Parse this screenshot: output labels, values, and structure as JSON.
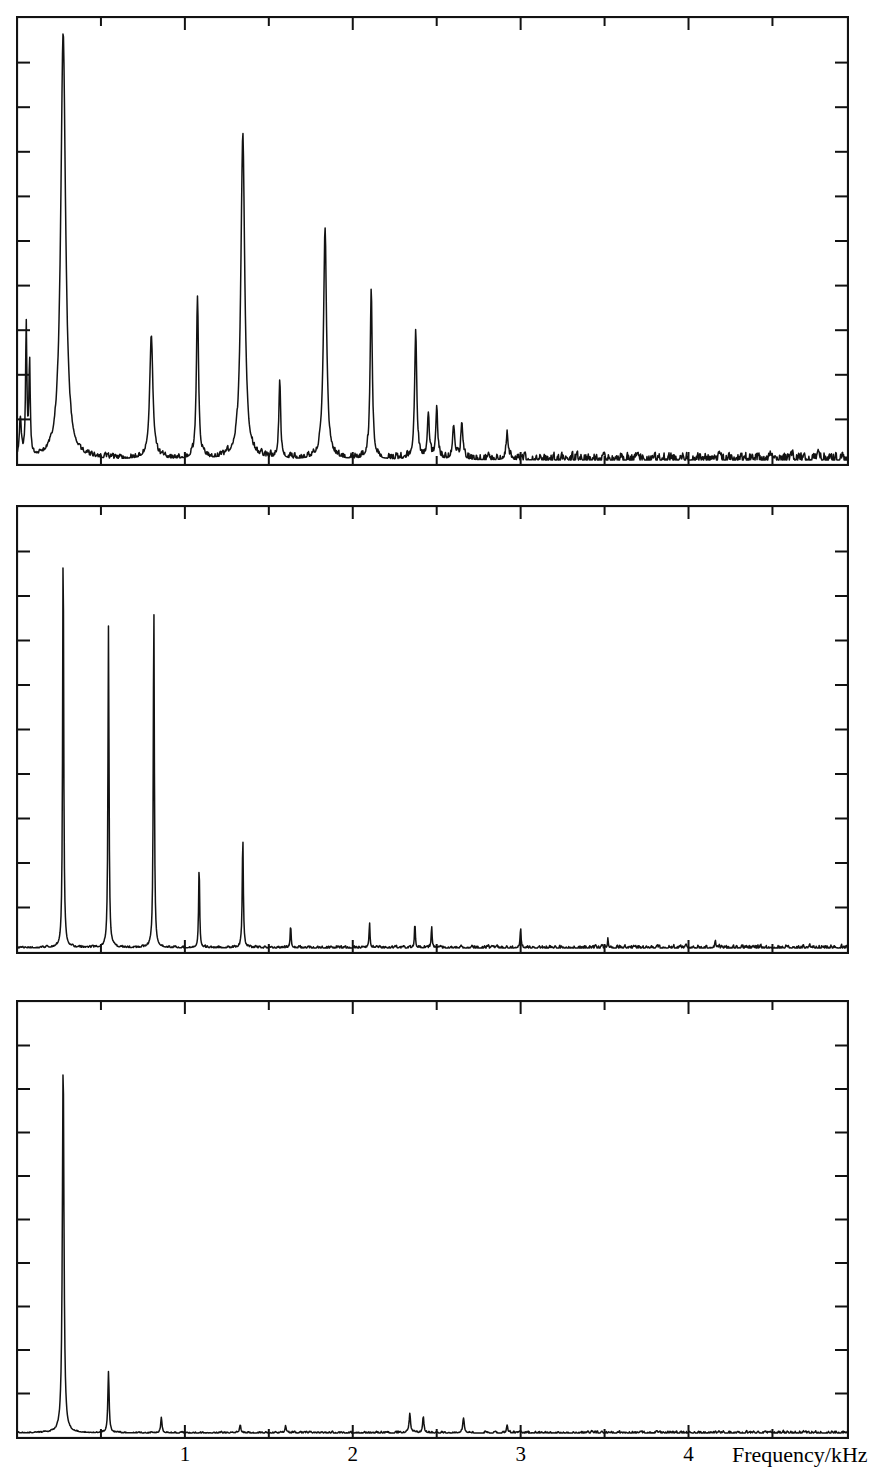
{
  "figure": {
    "kind": "stacked-spectra",
    "panel_count": 3,
    "ink_color": "#121212",
    "background_color": "#ffffff"
  },
  "axis": {
    "x_title": "Frequency/kHz",
    "x_tick_labels": [
      "1",
      "2",
      "3",
      "4"
    ],
    "x_tick_values": [
      1,
      2,
      3,
      4
    ],
    "x_minor_step": 0.5,
    "x_min": 0,
    "x_max": 4.95,
    "y_ticks_visible": true,
    "y_tick_count": 9,
    "y_labels": []
  },
  "chart_data": [
    {
      "type": "line",
      "name": "panel-top",
      "title": "",
      "xlabel": "",
      "ylabel": "",
      "xlim": [
        0,
        4.95
      ],
      "ylim": [
        0,
        1
      ],
      "grid": false,
      "legend": "none",
      "noise_level": 0.018,
      "noise_seed": 11,
      "peaks": [
        {
          "x": 0.02,
          "height": 0.09,
          "width": 0.012
        },
        {
          "x": 0.055,
          "height": 0.3,
          "width": 0.008
        },
        {
          "x": 0.075,
          "height": 0.22,
          "width": 0.008
        },
        {
          "x": 0.275,
          "height": 0.985,
          "width": 0.03
        },
        {
          "x": 0.8,
          "height": 0.285,
          "width": 0.02
        },
        {
          "x": 1.075,
          "height": 0.375,
          "width": 0.013
        },
        {
          "x": 1.345,
          "height": 0.745,
          "width": 0.024
        },
        {
          "x": 1.565,
          "height": 0.175,
          "width": 0.011
        },
        {
          "x": 1.835,
          "height": 0.53,
          "width": 0.019
        },
        {
          "x": 2.11,
          "height": 0.395,
          "width": 0.013
        },
        {
          "x": 2.375,
          "height": 0.3,
          "width": 0.013
        },
        {
          "x": 2.45,
          "height": 0.105,
          "width": 0.012
        },
        {
          "x": 2.5,
          "height": 0.115,
          "width": 0.012
        },
        {
          "x": 2.6,
          "height": 0.075,
          "width": 0.012
        },
        {
          "x": 2.65,
          "height": 0.085,
          "width": 0.012
        },
        {
          "x": 2.92,
          "height": 0.06,
          "width": 0.012
        }
      ]
    },
    {
      "type": "line",
      "name": "panel-middle",
      "title": "",
      "xlabel": "",
      "ylabel": "",
      "xlim": [
        0,
        4.95
      ],
      "ylim": [
        0,
        1
      ],
      "grid": false,
      "legend": "none",
      "noise_level": 0.007,
      "noise_seed": 29,
      "peaks": [
        {
          "x": 0.275,
          "height": 0.96,
          "width": 0.0065
        },
        {
          "x": 0.545,
          "height": 0.745,
          "width": 0.0065
        },
        {
          "x": 0.815,
          "height": 0.8,
          "width": 0.0065
        },
        {
          "x": 1.085,
          "height": 0.195,
          "width": 0.006
        },
        {
          "x": 1.345,
          "height": 0.26,
          "width": 0.0065
        },
        {
          "x": 1.63,
          "height": 0.055,
          "width": 0.0055
        },
        {
          "x": 2.1,
          "height": 0.06,
          "width": 0.0055
        },
        {
          "x": 2.37,
          "height": 0.055,
          "width": 0.0055
        },
        {
          "x": 2.47,
          "height": 0.05,
          "width": 0.0055
        },
        {
          "x": 3.0,
          "height": 0.045,
          "width": 0.0055
        },
        {
          "x": 3.52,
          "height": 0.02,
          "width": 0.0055
        },
        {
          "x": 4.16,
          "height": 0.018,
          "width": 0.0055
        }
      ]
    },
    {
      "type": "line",
      "name": "panel-bottom",
      "title": "",
      "xlabel": "",
      "ylabel": "",
      "xlim": [
        0,
        4.95
      ],
      "ylim": [
        0,
        1
      ],
      "grid": false,
      "legend": "none",
      "noise_level": 0.005,
      "noise_seed": 47,
      "peaks": [
        {
          "x": 0.275,
          "height": 0.88,
          "width": 0.01
        },
        {
          "x": 0.545,
          "height": 0.145,
          "width": 0.008
        },
        {
          "x": 0.86,
          "height": 0.035,
          "width": 0.008
        },
        {
          "x": 1.33,
          "height": 0.02,
          "width": 0.007
        },
        {
          "x": 1.6,
          "height": 0.018,
          "width": 0.007
        },
        {
          "x": 2.34,
          "height": 0.045,
          "width": 0.009
        },
        {
          "x": 2.42,
          "height": 0.04,
          "width": 0.008
        },
        {
          "x": 2.66,
          "height": 0.035,
          "width": 0.009
        },
        {
          "x": 2.92,
          "height": 0.018,
          "width": 0.007
        }
      ]
    }
  ],
  "panels": [
    {
      "name": "top",
      "left": 16,
      "top": 16,
      "width": 833,
      "height": 450
    },
    {
      "name": "middle",
      "left": 16,
      "top": 505,
      "width": 833,
      "height": 449
    },
    {
      "name": "bottom",
      "left": 16,
      "top": 1000,
      "width": 833,
      "height": 439
    }
  ]
}
